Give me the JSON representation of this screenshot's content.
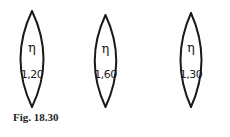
{
  "figure": {
    "caption": "Fig. 18.30",
    "lenses": [
      {
        "symbol": "η",
        "index": "1,20"
      },
      {
        "symbol": "η",
        "index": "1,60"
      },
      {
        "symbol": "η",
        "index": "1,30"
      }
    ]
  },
  "colors": {
    "stroke": "#1a1a1a",
    "background": "#ffffff"
  }
}
